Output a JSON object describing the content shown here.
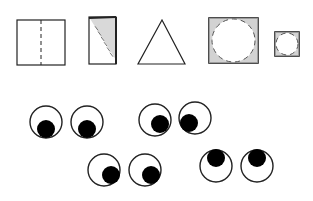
{
  "colors": {
    "background": "#ffffff",
    "line": "#222222",
    "pupil": "#000000",
    "shading": "#555555"
  },
  "shapes": [
    {
      "kind": "square-with-fold-line",
      "x": 17,
      "y": 20,
      "w": 48,
      "h": 45,
      "fold_x": 41
    },
    {
      "kind": "folded-rectangle-shaded",
      "x": 89,
      "y": 17,
      "w": 27,
      "h": 47
    },
    {
      "kind": "triangle",
      "points": [
        [
          162,
          20
        ],
        [
          138,
          64
        ],
        [
          185,
          64
        ]
      ]
    },
    {
      "kind": "square-with-circle-corners-shaded",
      "x": 209,
      "y": 18,
      "w": 49,
      "h": 45
    },
    {
      "kind": "small-square-with-circle-corners-shaded",
      "x": 275,
      "y": 32,
      "w": 24,
      "h": 24
    }
  ],
  "eye_pairs": [
    {
      "eyes": [
        {
          "cx": 46,
          "cy": 122,
          "r": 16,
          "px": 46,
          "py": 129
        },
        {
          "cx": 87,
          "cy": 122,
          "r": 16,
          "px": 87,
          "py": 129
        }
      ],
      "gaze": "down"
    },
    {
      "eyes": [
        {
          "cx": 155,
          "cy": 120,
          "r": 16,
          "px": 160,
          "py": 124
        },
        {
          "cx": 195,
          "cy": 118,
          "r": 16,
          "px": 189,
          "py": 123
        }
      ],
      "gaze": "down-center"
    },
    {
      "eyes": [
        {
          "cx": 104,
          "cy": 170,
          "r": 16,
          "px": 111,
          "py": 175
        },
        {
          "cx": 145,
          "cy": 170,
          "r": 16,
          "px": 151,
          "py": 175
        }
      ],
      "gaze": "down-right"
    },
    {
      "eyes": [
        {
          "cx": 216,
          "cy": 166,
          "r": 16,
          "px": 216,
          "py": 158
        },
        {
          "cx": 257,
          "cy": 166,
          "r": 16,
          "px": 257,
          "py": 158
        }
      ],
      "gaze": "up"
    }
  ]
}
